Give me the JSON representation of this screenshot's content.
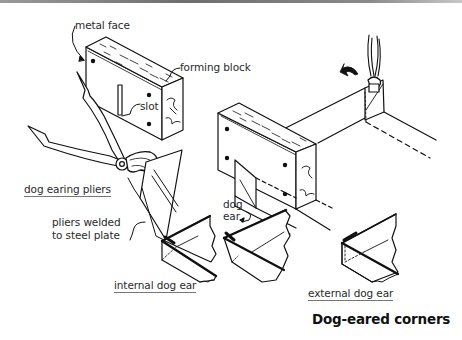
{
  "figure": {
    "title": "Dog-eared corners",
    "labels": {
      "metal_face": "metal face",
      "forming_block": "forming block",
      "slot": "slot",
      "dog_earing_pliers": "dog earing pliers",
      "pliers_welded_line1": "pliers welded",
      "pliers_welded_line2": "to steel plate",
      "dog_ear_line1": "dog",
      "dog_ear_line2": "ear",
      "internal_dog_ear": "internal dog ear",
      "external_dog_ear": "external dog ear"
    },
    "components": [
      "forming-block",
      "dog-earing-pliers",
      "block-with-bent-sheet",
      "vertical-pliers",
      "rotation-arrow",
      "internal-dog-ear-gutter",
      "dog-ear-gutter-middle",
      "external-dog-ear-gutter"
    ],
    "colors": {
      "ink": "#111111",
      "label": "#2a2a2a",
      "underline": "#777777",
      "top_rule": "#7a7a7a"
    }
  }
}
